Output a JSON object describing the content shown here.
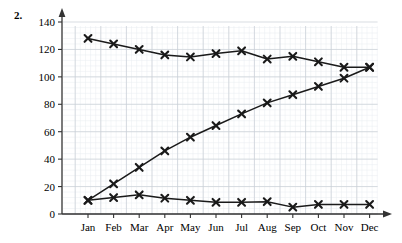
{
  "question": {
    "number": "2."
  },
  "chart_data": {
    "type": "line",
    "title": "",
    "xlabel": "",
    "ylabel": "",
    "categories": [
      "Jan",
      "Feb",
      "Mar",
      "Apr",
      "May",
      "Jun",
      "Jul",
      "Aug",
      "Sep",
      "Oct",
      "Nov",
      "Dec"
    ],
    "ylim": [
      0,
      140
    ],
    "yticks": [
      0,
      20,
      40,
      60,
      80,
      100,
      120,
      140
    ],
    "ytick_labels": [
      "0",
      "20",
      "40",
      "60",
      "80",
      "100",
      "120",
      "140"
    ],
    "grid": true,
    "grid_minor": true,
    "legend": "none",
    "marker": "x",
    "line_color": "#1a1a1a",
    "grid_color": "#c9cfd6",
    "grid_minor_color": "#e8ecf0",
    "axis_color": "#4a4a4a",
    "series": [
      {
        "name": "declining",
        "values": [
          128,
          124,
          120,
          116,
          114.5,
          117,
          119,
          113,
          115,
          111,
          107,
          107
        ]
      },
      {
        "name": "rising",
        "values": [
          10,
          22,
          34,
          46,
          56,
          64.5,
          73,
          81,
          87,
          93,
          99,
          107
        ]
      },
      {
        "name": "flat",
        "values": [
          10,
          12,
          14,
          11.5,
          10,
          8.5,
          8.5,
          9,
          5,
          7,
          7,
          7
        ]
      }
    ]
  }
}
